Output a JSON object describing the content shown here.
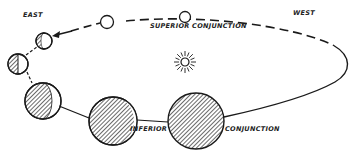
{
  "labels": {
    "east": "EAST",
    "west": "WEST",
    "superior": "SUPERIOR  CONJUNCTION",
    "inferior": "INFERIOR",
    "conjunction": "CONJUNCTION"
  },
  "colors": {
    "ink": "#1a1a1a",
    "background": "#ffffff"
  },
  "phases": [
    {
      "name": "superior-conjunction",
      "lit_fraction": 1.0
    },
    {
      "name": "full-gibbous",
      "lit_fraction": 1.0
    },
    {
      "name": "gibbous",
      "lit_fraction": 0.7
    },
    {
      "name": "half",
      "lit_fraction": 0.5
    },
    {
      "name": "crescent",
      "lit_fraction": 0.2
    },
    {
      "name": "thin-crescent",
      "lit_fraction": 0.05
    },
    {
      "name": "inferior-conjunction",
      "lit_fraction": 0.0
    }
  ]
}
